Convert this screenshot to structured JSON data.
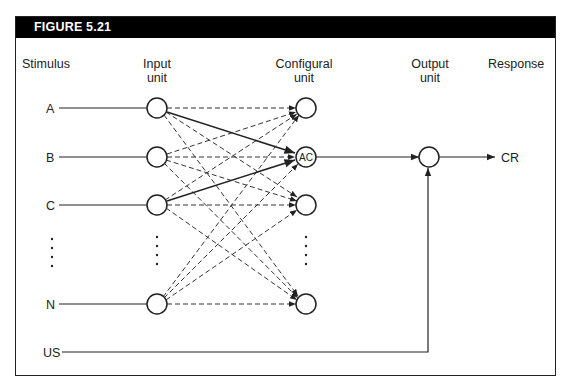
{
  "figure": {
    "title": "FIGURE 5.21"
  },
  "columns": {
    "stimulus": "Stimulus",
    "input_line1": "Input",
    "input_line2": "unit",
    "configural_line1": "Configural",
    "configural_line2": "unit",
    "output_line1": "Output",
    "output_line2": "unit",
    "response": "Response"
  },
  "stimuli": [
    "A",
    "B",
    "C",
    "N"
  ],
  "us_label": "US",
  "configural_active_label": "AC",
  "response_label": "CR",
  "colors": {
    "header_bg": "#000000",
    "line": "#222222",
    "background": "#ffffff"
  }
}
